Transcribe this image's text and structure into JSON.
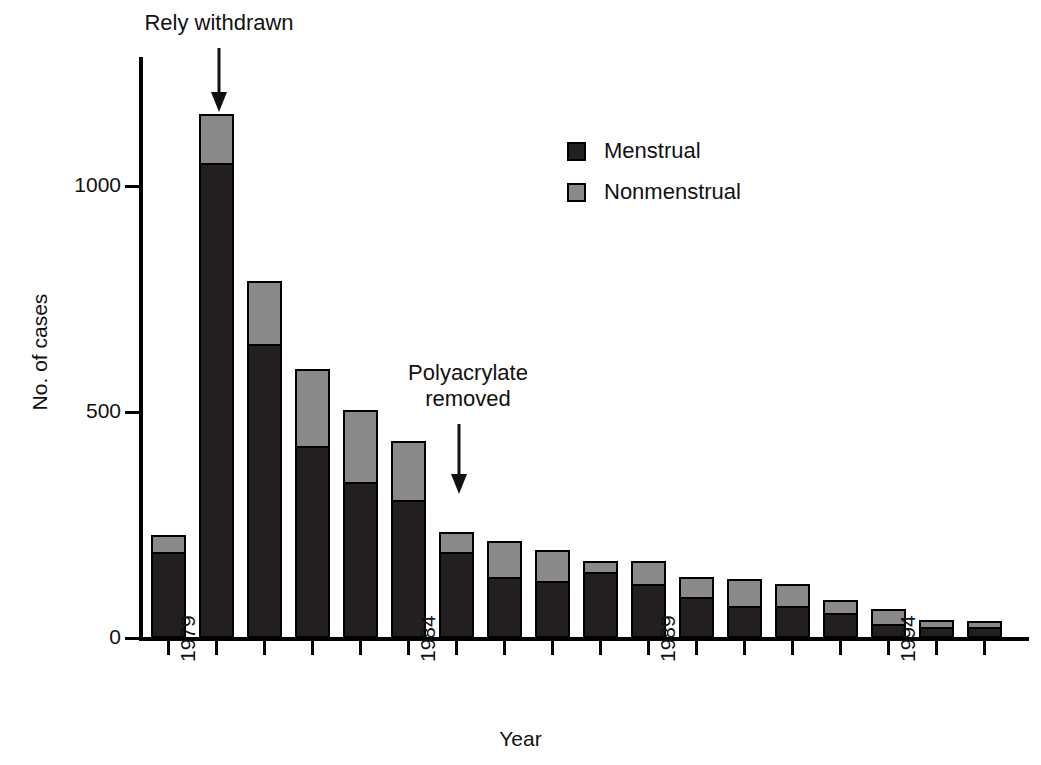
{
  "figure": {
    "background": "#ffffff",
    "menstrual_color": "#231f20",
    "nonmenstrual_color": "#898989"
  },
  "axes": {
    "x_title": "Year",
    "y_title": "No. of cases",
    "y_ticks": [
      "0",
      "500",
      "1000"
    ],
    "x_tick_labels": [
      "1979",
      "1984",
      "1989",
      "1994"
    ]
  },
  "legend": {
    "items": [
      {
        "label": "Menstrual",
        "color": "#231f20"
      },
      {
        "label": "Nonmenstrual",
        "color": "#898989"
      }
    ]
  },
  "annotations": [
    {
      "text": "Rely withdrawn",
      "icon": "down-arrow-icon"
    },
    {
      "text": "Polyacrylate\nremoved",
      "icon": "down-arrow-icon"
    }
  ],
  "chart_data": {
    "type": "bar",
    "stacked": true,
    "title": "",
    "xlabel": "Year",
    "ylabel": "No. of cases",
    "ylim": [
      0,
      1270
    ],
    "yticks": [
      0,
      500,
      1000
    ],
    "grid": false,
    "legend_position": "upper-right-inside",
    "categories": [
      "1979",
      "1980",
      "1981",
      "1982",
      "1983",
      "1984",
      "1985",
      "1986",
      "1987",
      "1988",
      "1989",
      "1990",
      "1991",
      "1992",
      "1993",
      "1994",
      "1995",
      "1996"
    ],
    "labeled_ticks": [
      "1979",
      "1984",
      "1989",
      "1994"
    ],
    "series": [
      {
        "name": "Menstrual",
        "color": "#231f20",
        "values": [
          190,
          1050,
          650,
          425,
          345,
          305,
          190,
          135,
          125,
          145,
          120,
          90,
          70,
          70,
          55,
          30,
          25,
          25
        ]
      },
      {
        "name": "Nonmenstrual",
        "color": "#898989",
        "values": [
          38,
          110,
          140,
          170,
          160,
          130,
          45,
          80,
          70,
          25,
          50,
          45,
          60,
          50,
          30,
          35,
          15,
          12
        ]
      }
    ],
    "totals": [
      228,
      1160,
      790,
      595,
      505,
      435,
      235,
      215,
      195,
      170,
      170,
      135,
      130,
      120,
      85,
      65,
      40,
      37
    ],
    "annotations": [
      {
        "text": "Rely withdrawn",
        "points_to_category": "1980"
      },
      {
        "text": "Polyacrylate removed",
        "points_to_category": "1985"
      }
    ]
  }
}
